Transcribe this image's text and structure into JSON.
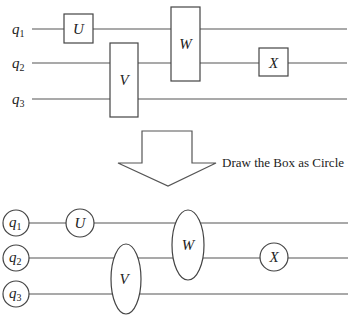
{
  "top_circuit": {
    "qubits": [
      {
        "name": "q",
        "index": "1"
      },
      {
        "name": "q",
        "index": "2"
      },
      {
        "name": "q",
        "index": "3"
      }
    ],
    "gates": [
      {
        "label": "U",
        "shape": "box",
        "qubits": [
          "q1"
        ]
      },
      {
        "label": "V",
        "shape": "box",
        "qubits": [
          "q2",
          "q3"
        ]
      },
      {
        "label": "W",
        "shape": "box",
        "qubits": [
          "q1",
          "q2"
        ]
      },
      {
        "label": "X",
        "shape": "box",
        "qubits": [
          "q2"
        ]
      }
    ]
  },
  "transition": {
    "arrow": "down-arrow",
    "caption": "Draw the Box as Circle"
  },
  "bottom_circuit": {
    "qubits": [
      {
        "name": "q",
        "index": "1"
      },
      {
        "name": "q",
        "index": "2"
      },
      {
        "name": "q",
        "index": "3"
      }
    ],
    "gates": [
      {
        "label": "U",
        "shape": "circle",
        "qubits": [
          "q1"
        ]
      },
      {
        "label": "V",
        "shape": "ellipse",
        "qubits": [
          "q2",
          "q3"
        ]
      },
      {
        "label": "W",
        "shape": "ellipse",
        "qubits": [
          "q1",
          "q2"
        ]
      },
      {
        "label": "X",
        "shape": "circle",
        "qubits": [
          "q2"
        ]
      }
    ]
  },
  "colors": {
    "line": "#555555",
    "text": "#222222",
    "background": "#ffffff"
  }
}
